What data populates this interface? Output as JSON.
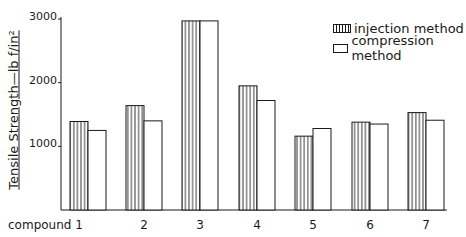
{
  "chart_data": {
    "type": "bar",
    "title": "",
    "xlabel": "",
    "ylabel": "Tensile Strength—lb f/in²",
    "ylim": [
      0,
      3000
    ],
    "yticks": [
      1000,
      2000,
      3000
    ],
    "ytick_labels": [
      "1000",
      "2000",
      "3000"
    ],
    "categories": [
      "compound 1",
      "2",
      "3",
      "4",
      "5",
      "6",
      "7"
    ],
    "series": [
      {
        "name": "injection method",
        "pattern": "vertical-hatch",
        "values": [
          1390,
          1640,
          2970,
          1950,
          1160,
          1380,
          1530
        ]
      },
      {
        "name": "compression method",
        "pattern": "open",
        "values": [
          1250,
          1400,
          2970,
          1720,
          1280,
          1350,
          1410
        ]
      }
    ],
    "legend_position": "top-right",
    "grid": false
  },
  "colors": {
    "ink": "#1a1a1a",
    "background": "#ffffff"
  }
}
